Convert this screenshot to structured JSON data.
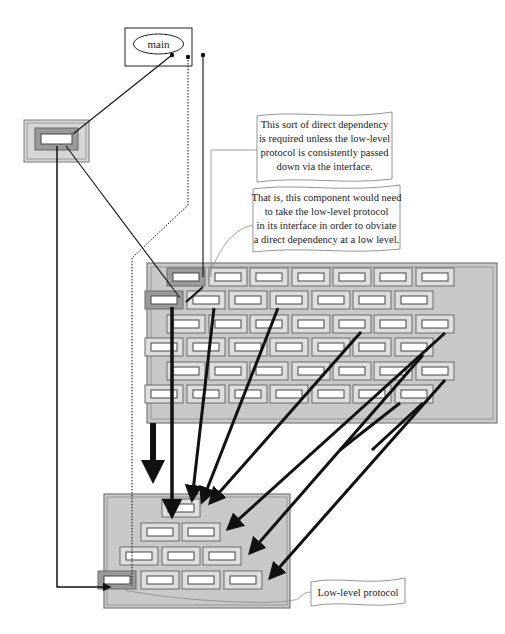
{
  "main_module": {
    "label": "main",
    "box": [
      125,
      28,
      67,
      38
    ]
  },
  "callouts": [
    {
      "id": "direct-dependency-note",
      "lines": [
        "This sort of direct dependency",
        "is required unless the low-level",
        "protocol is consistently passed",
        "down via the interface."
      ],
      "box": [
        257,
        112,
        135,
        70
      ]
    },
    {
      "id": "interface-note",
      "lines": [
        "That is, this component would need",
        "to take the low-level protocol",
        "in its interface in order to obviate",
        "a direct dependency at a low level."
      ],
      "box": [
        253,
        185,
        147,
        67
      ]
    },
    {
      "id": "low-level-protocol-label",
      "lines": [
        "Low-level protocol"
      ],
      "box": [
        311,
        578,
        94,
        28
      ]
    }
  ],
  "colors": {
    "panel_fill": "#c8c8c8",
    "panel_border": "#7a7a7a",
    "tile_fill": "#dedede",
    "tile_highlight": "#9a9a9a",
    "slot_fill": "#ffffff",
    "line": "#111111"
  },
  "left_component": {
    "box": [
      24,
      120,
      65,
      42
    ]
  },
  "upper_grid": {
    "box": [
      147,
      263,
      350,
      160
    ],
    "rows": [
      {
        "y": 277,
        "xs": [
          186,
          228,
          269,
          311,
          352,
          393,
          435
        ],
        "highlight": [
          0
        ]
      },
      {
        "y": 300,
        "xs": [
          164,
          206,
          248,
          289,
          331,
          372,
          414
        ],
        "highlight": [
          0
        ]
      },
      {
        "y": 324,
        "xs": [
          186,
          228,
          269,
          311,
          352,
          393,
          435
        ],
        "highlight": []
      },
      {
        "y": 347,
        "xs": [
          164,
          206,
          248,
          289,
          331,
          372,
          414
        ],
        "highlight": []
      },
      {
        "y": 371,
        "xs": [
          186,
          228,
          269,
          311,
          352,
          393,
          435
        ],
        "highlight": []
      },
      {
        "y": 394,
        "xs": [
          164,
          206,
          248,
          289,
          331,
          372,
          414
        ],
        "highlight": []
      }
    ]
  },
  "lower_grid": {
    "box": [
      104,
      494,
      186,
      114
    ],
    "rows": [
      {
        "y": 508,
        "xs": [
          181
        ],
        "highlight": []
      },
      {
        "y": 532,
        "xs": [
          160,
          201
        ],
        "highlight": []
      },
      {
        "y": 556,
        "xs": [
          139,
          181,
          222
        ],
        "highlight": []
      },
      {
        "y": 580,
        "xs": [
          117,
          160,
          201,
          243
        ],
        "highlight": [
          0
        ]
      }
    ]
  },
  "caption": {
    "visible_text": ""
  }
}
